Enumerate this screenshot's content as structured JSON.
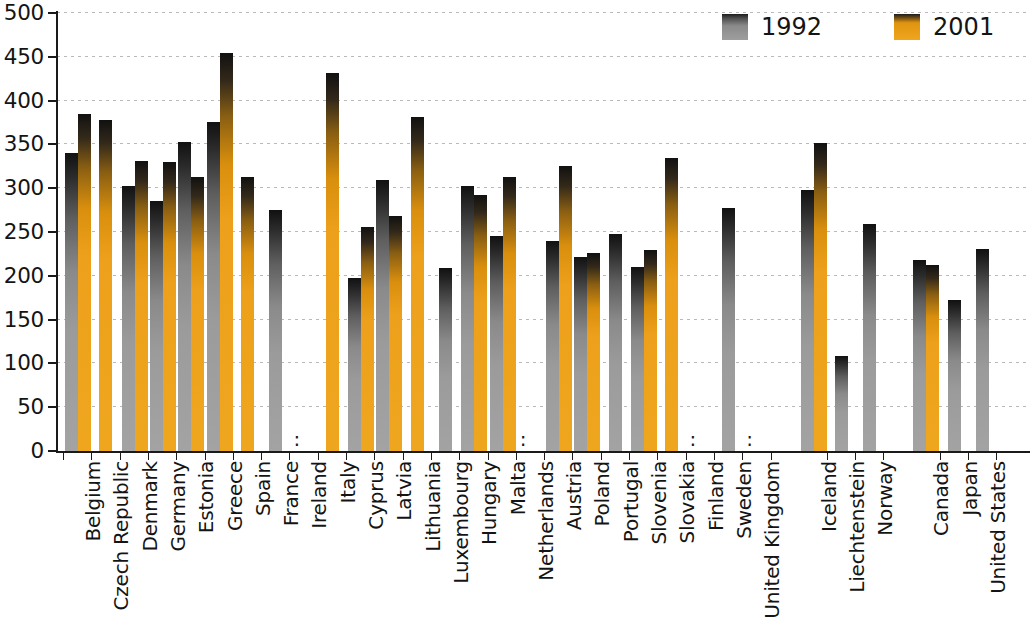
{
  "chart_data": {
    "type": "bar",
    "title": "",
    "subtitle": "",
    "xlabel": "",
    "ylabel": "",
    "ylim": [
      0,
      500
    ],
    "yticks": [
      0,
      50,
      100,
      150,
      200,
      250,
      300,
      350,
      400,
      450,
      500
    ],
    "grid": true,
    "legend_position": "top-right",
    "missing_marker": ":",
    "categories": [
      "Belgium",
      "Czech Republic",
      "Denmark",
      "Germany",
      "Estonia",
      "Greece",
      "Spain",
      "France",
      "Ireland",
      "Italy",
      "Cyprus",
      "Latvia",
      "Lithuania",
      "Luxembourg",
      "Hungary",
      "Malta",
      "Netherlands",
      "Austria",
      "Poland",
      "Portugal",
      "Slovenia",
      "Slovakia",
      "Finland",
      "Sweden",
      "United Kingdom",
      "Iceland",
      "Liechtenstein",
      "Norway",
      "Canada",
      "Japan",
      "United States"
    ],
    "group_breaks_after": [
      "United Kingdom",
      "Norway"
    ],
    "series": [
      {
        "name": "1992",
        "color": "#9b9b9b",
        "values": [
          340,
          null,
          303,
          285,
          353,
          376,
          null,
          275,
          null,
          null,
          197,
          309,
          null,
          209,
          303,
          245,
          null,
          240,
          222,
          248,
          210,
          null,
          null,
          277,
          null,
          298,
          108,
          259,
          218,
          172,
          231
        ]
      },
      {
        "name": "2001",
        "color": "#efa61f",
        "values": [
          385,
          378,
          331,
          330,
          313,
          454,
          313,
          null,
          null,
          432,
          256,
          268,
          381,
          null,
          292,
          313,
          null,
          325,
          226,
          null,
          230,
          335,
          null,
          null,
          null,
          352,
          null,
          null,
          212,
          null,
          null
        ]
      }
    ]
  },
  "legend": {
    "items": [
      {
        "label": "1992",
        "swatch": "gray-swatch"
      },
      {
        "label": "2001",
        "swatch": "orange-swatch"
      }
    ]
  },
  "axis": {
    "y_tick_labels": [
      "500",
      "450",
      "400",
      "350",
      "300",
      "250",
      "200",
      "150",
      "100",
      "50",
      "0"
    ]
  }
}
